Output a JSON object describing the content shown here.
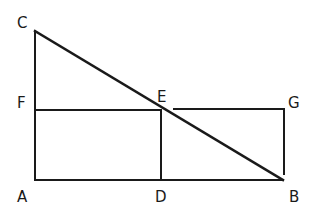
{
  "diagram": {
    "type": "geometry",
    "stroke_color": "#1a1a1a",
    "labels": {
      "C": "C",
      "F": "F",
      "E": "E",
      "G": "G",
      "A": "A",
      "D": "D",
      "B": "B"
    },
    "points": {
      "A": [
        35,
        180
      ],
      "B": [
        283,
        180
      ],
      "C": [
        35,
        31
      ],
      "D": [
        161,
        180
      ],
      "E": [
        161,
        110
      ],
      "F": [
        35,
        110
      ],
      "G": [
        284,
        109
      ]
    },
    "segments": [
      [
        "A",
        "C"
      ],
      [
        "C",
        "B"
      ],
      [
        "A",
        "B"
      ],
      [
        "F",
        "E"
      ],
      [
        "E",
        "D"
      ],
      [
        "E",
        "G"
      ],
      [
        "G",
        "B"
      ]
    ]
  }
}
